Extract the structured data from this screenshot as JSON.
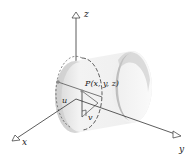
{
  "diagram": {
    "axes": {
      "x_label": "x",
      "y_label": "y",
      "z_label": "z"
    },
    "point_label": "P(x, y, z)",
    "parameter_labels": {
      "u": "u",
      "v": "v"
    },
    "colors": {
      "surface_light": "#f2f2f2",
      "surface_dark": "#bdbdbd",
      "axis": "#333333",
      "dot": "#8a8a8a"
    }
  }
}
